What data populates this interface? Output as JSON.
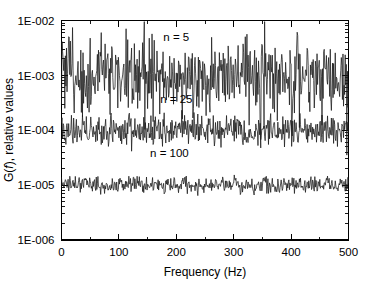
{
  "chart_data": {
    "type": "line",
    "title": "",
    "xlabel": "Frequency (Hz)",
    "ylabel": "G(f), relative values",
    "ylabel_parts": {
      "pre": "G(",
      "italic": "f",
      "post": "), relative values"
    },
    "xlim": [
      0,
      500
    ],
    "ylim": [
      1e-06,
      0.01
    ],
    "yscale": "log",
    "xscale": "linear",
    "grid": false,
    "legend": "none",
    "x_ticks": [
      0,
      100,
      200,
      300,
      400,
      500
    ],
    "x_tick_labels": [
      "0",
      "100",
      "200",
      "300",
      "400",
      "500"
    ],
    "x_minor_interval": 50,
    "y_ticks": [
      0.01,
      0.001,
      0.0001,
      1e-05,
      1e-06
    ],
    "y_tick_labels": [
      "1E-002",
      "1E-003",
      "1E-004",
      "1E-005",
      "1E-006"
    ],
    "series": [
      {
        "name": "n = 5",
        "mean_level": 0.001,
        "averages": 5,
        "scatter_decades": 0.46,
        "annotation": "n = 5",
        "annotation_x": 200,
        "annotation_y": 0.0042,
        "color": "#1a1a1a"
      },
      {
        "name": "n = 25",
        "mean_level": 0.0001,
        "averages": 25,
        "scatter_decades": 0.2,
        "annotation": "n = 25",
        "annotation_x": 200,
        "annotation_y": 0.00032,
        "color": "#1a1a1a"
      },
      {
        "name": "n = 100",
        "mean_level": 1e-05,
        "averages": 100,
        "scatter_decades": 0.1,
        "annotation": "n = 100",
        "annotation_x": 188,
        "annotation_y": 3.2e-05,
        "color": "#1a1a1a"
      }
    ]
  },
  "axes": {
    "x_title": "Frequency (Hz)",
    "y_title_pre": "G(",
    "y_title_italic": "f",
    "y_title_post": "), relative values"
  },
  "annotations": [
    {
      "label": "n = 5"
    },
    {
      "label": "n = 25"
    },
    {
      "label": "n = 100"
    }
  ],
  "x_tick_labels": [
    "0",
    "100",
    "200",
    "300",
    "400",
    "500"
  ],
  "y_tick_labels": [
    "1E-002",
    "1E-003",
    "1E-004",
    "1E-005",
    "1E-006"
  ],
  "colors": {
    "trace": "#1a1a1a",
    "axis": "#000000",
    "background": "#ffffff"
  }
}
